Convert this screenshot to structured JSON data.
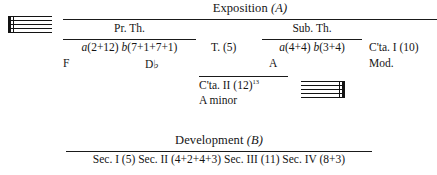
{
  "figure": {
    "type": "musical-form-diagram",
    "ink_color": "#151515"
  },
  "exposition": {
    "title": "Exposition",
    "title_letter": "(A)",
    "primary_theme": {
      "label": "Pr. Th.",
      "subdivisions": "a(2+12) b(7+1+7+1)",
      "key_left": "F",
      "key_right": "D♭"
    },
    "transition": {
      "label": "T. (5)"
    },
    "subordinate_theme": {
      "label": "Sub. Th.",
      "subdivisions": "a(4+4) b(3+4)",
      "key": "A"
    },
    "closing_one": {
      "label": "C'ta. I (10)",
      "key": "Mod."
    },
    "closing_two": {
      "label": "C'ta. II (12)",
      "footnote": "13",
      "key": "A minor"
    }
  },
  "development": {
    "title": "Development",
    "title_letter": "(B)",
    "sections": "Sec. I (5) Sec. II (4+2+4+3) Sec. III (11) Sec. IV (8+3)"
  },
  "icons": {
    "staff_open": "music-staff-icon",
    "staff_end": "music-staff-end-icon"
  }
}
